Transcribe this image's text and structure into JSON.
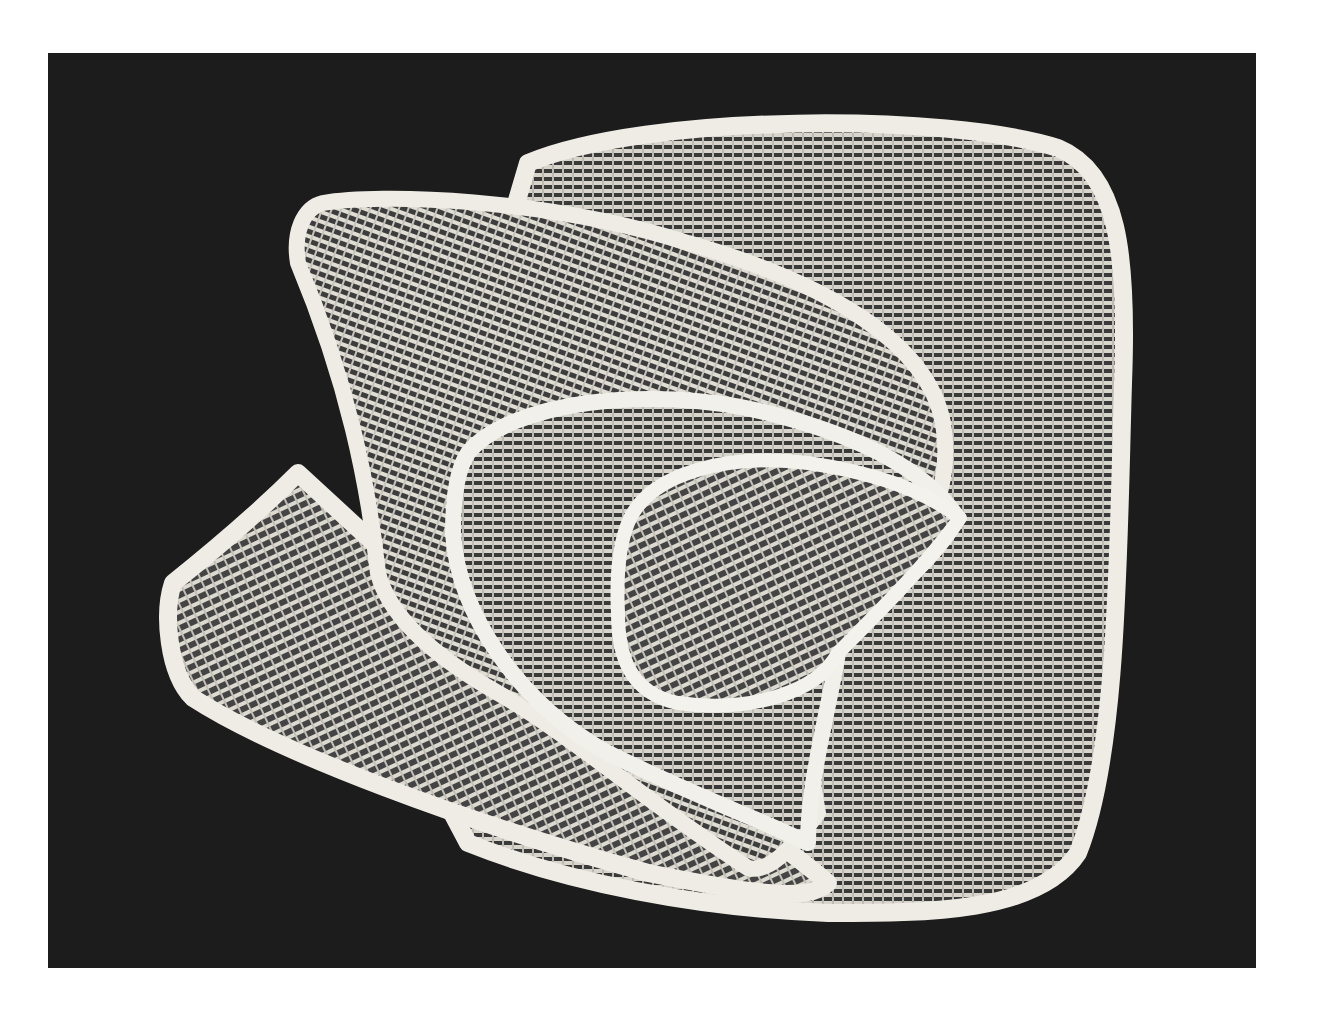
{
  "image": {
    "subject": "nested woven baskets photographed from above on a black background",
    "background_color": "#1c1c1c",
    "page_color": "#ffffff",
    "basket_color": "#e6e3dc",
    "rim_color": "#f2f0ea",
    "shadow_color": "#2a2a2a",
    "baskets": [
      {
        "name": "outer-rounded-basket"
      },
      {
        "name": "left-fan-basket"
      },
      {
        "name": "upper-fan-basket"
      },
      {
        "name": "middle-teardrop-basket"
      },
      {
        "name": "inner-teardrop-basket"
      }
    ]
  }
}
